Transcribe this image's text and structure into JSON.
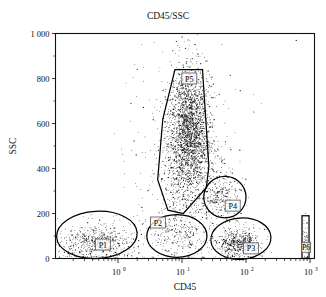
{
  "chart_data": {
    "type": "scatter",
    "title": "CD45/SSC",
    "xlabel": "CD45",
    "ylabel": "SSC",
    "xscale": "log",
    "yscale": "linear",
    "xlim": [
      0.2,
      1000
    ],
    "ylim": [
      0,
      1000
    ],
    "grid": false,
    "legend": "none",
    "x_tick_labels": [
      "10",
      "10",
      "10",
      "10"
    ],
    "x_tick_exponents": [
      "0",
      "1",
      "2",
      "3"
    ],
    "x_tick_values": [
      1,
      10,
      100,
      1000
    ],
    "y_tick_labels": [
      "1 000",
      "800",
      "600",
      "400",
      "200",
      "0"
    ],
    "y_tick_values": [
      1000,
      800,
      600,
      400,
      200,
      0
    ],
    "annotations": [
      {
        "name": "P1",
        "label": "P1",
        "shape": "ellipse",
        "description": "lymphocyte-low-CD45 population gate, lower left",
        "center_x_log": 0.52,
        "center_y": 95,
        "label_x": 0.58,
        "label_y": 62
      },
      {
        "name": "P2",
        "label": "P2",
        "shape": "ellipse",
        "description": "mid-CD45 low-SSC population gate, bottom center",
        "center_x_log": 8.0,
        "center_y": 105,
        "label_x": 4.2,
        "label_y": 160
      },
      {
        "name": "P3",
        "label": "P3",
        "shape": "ellipse",
        "description": "high-CD45 low-SSC lymphocyte gate, bottom right",
        "center_x_log": 78,
        "center_y": 80,
        "label_x": 120,
        "label_y": 45
      },
      {
        "name": "P4",
        "label": "P4",
        "shape": "ellipse",
        "description": "monocyte gate, mid-right",
        "center_x_log": 48,
        "center_y": 270,
        "label_x": 62,
        "label_y": 235
      },
      {
        "name": "P5",
        "label": "P5",
        "shape": "polygon",
        "description": "granulocyte polygon gate, high SSC",
        "label_x": 13,
        "label_y": 800
      },
      {
        "name": "P6",
        "label": "P6",
        "shape": "rectangle",
        "description": "narrow off-scale gate at right edge",
        "label_x": 870,
        "label_y": 50
      }
    ],
    "series": [
      {
        "name": "events",
        "description": "flow cytometry event cloud; CD45 vs side scatter",
        "marker": "point",
        "color": "#1a1a1a",
        "clusters": [
          {
            "name": "P1-debris",
            "n": 620,
            "cx_log10": -0.32,
            "cy": 70,
            "sx_log10": 0.3,
            "sy": 42
          },
          {
            "name": "P2-mid",
            "n": 200,
            "cx_log10": 0.92,
            "cy": 105,
            "sx_log10": 0.22,
            "sy": 40
          },
          {
            "name": "P3-lymphocytes",
            "n": 520,
            "cx_log10": 1.88,
            "cy": 68,
            "sx_log10": 0.17,
            "sy": 32
          },
          {
            "name": "P4-monocytes",
            "n": 240,
            "cx_log10": 1.63,
            "cy": 272,
            "sx_log10": 0.16,
            "sy": 52
          },
          {
            "name": "P5-granulocytes",
            "n": 2600,
            "cx_log10": 1.12,
            "cy": 545,
            "sx_log10": 0.18,
            "sy": 150
          },
          {
            "name": "scatter-noise",
            "n": 420,
            "cx_log10": 1.05,
            "cy": 430,
            "sx_log10": 0.42,
            "sy": 260
          },
          {
            "name": "P6-offscale",
            "n": 70,
            "cx_log10": 2.93,
            "cy": 70,
            "sx_log10": 0.03,
            "sy": 45
          }
        ]
      }
    ]
  }
}
